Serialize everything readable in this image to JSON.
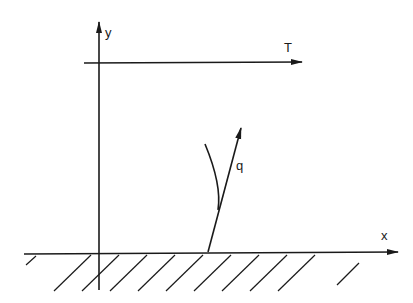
{
  "figure": {
    "axes": {
      "x_label": "x",
      "y_label": "y"
    },
    "temperature_line": {
      "label": "T"
    },
    "heat_flux_vector": {
      "label": "q"
    },
    "surface": {
      "description": "hatched solid wall"
    }
  }
}
